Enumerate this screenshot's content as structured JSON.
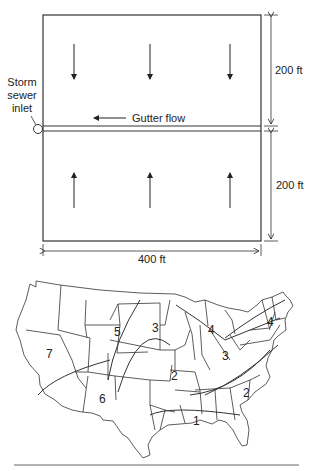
{
  "figure": {
    "plot": {
      "dimension_top": "200 ft",
      "dimension_bottom": "200 ft",
      "dimension_width": "400 ft",
      "inlet_label_line1": "Storm",
      "inlet_label_line2": "sewer",
      "inlet_label_line3": "inlet",
      "gutter_label": "Gutter flow",
      "flow_arrows_top": [
        "down",
        "down",
        "down"
      ],
      "flow_arrows_bottom": [
        "up",
        "up",
        "up"
      ]
    },
    "map": {
      "regions": [
        {
          "id": "region-1",
          "label": "1"
        },
        {
          "id": "region-2-central",
          "label": "2"
        },
        {
          "id": "region-2-east",
          "label": "2"
        },
        {
          "id": "region-3-central",
          "label": "3"
        },
        {
          "id": "region-3-ohio",
          "label": "3"
        },
        {
          "id": "region-4-lakes",
          "label": "4"
        },
        {
          "id": "region-4-northeast",
          "label": "4"
        },
        {
          "id": "region-5",
          "label": "5"
        },
        {
          "id": "region-6",
          "label": "6"
        },
        {
          "id": "region-7",
          "label": "7"
        }
      ]
    }
  }
}
